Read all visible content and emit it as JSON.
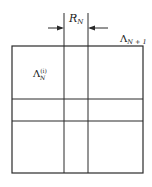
{
  "diagram": {
    "labels": {
      "width_label": "R",
      "width_label_sub": "N",
      "outer_region_label": "Λ",
      "outer_region_sub": "N + 1",
      "inner_region_label": "Λ",
      "inner_region_sup": "(i)",
      "inner_region_sub": "N"
    },
    "colors": {
      "line": "#2a2a2a",
      "background": "#ffffff"
    }
  }
}
